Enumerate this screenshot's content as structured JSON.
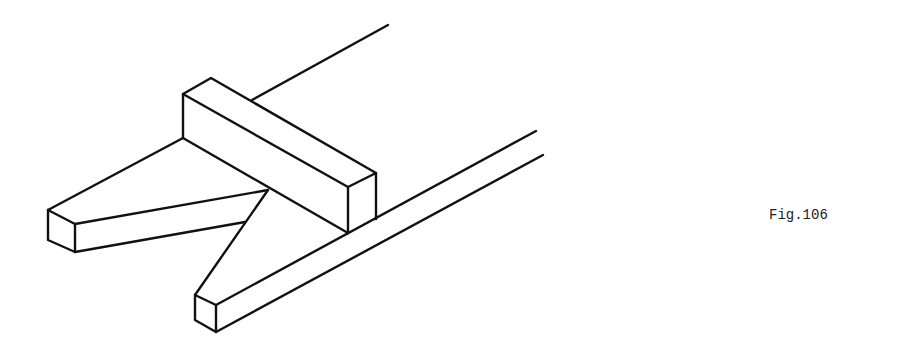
{
  "figure": {
    "caption": "Fig.106",
    "stroke_color": "#111111",
    "background": "#ffffff"
  }
}
